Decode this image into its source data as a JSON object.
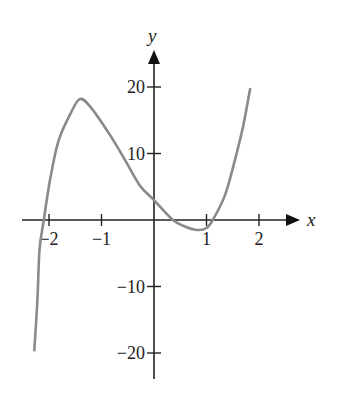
{
  "chart_data": {
    "type": "line",
    "title": "",
    "xlabel": "x",
    "ylabel": "y",
    "xlim": [
      -2.35,
      2.5
    ],
    "ylim": [
      -24,
      25
    ],
    "grid": false,
    "legend": null,
    "x_ticks": [
      -2,
      -1,
      1,
      2
    ],
    "x_tick_labels": [
      "−2",
      "−1",
      "1",
      "2"
    ],
    "y_ticks": [
      20,
      10,
      -10,
      -20
    ],
    "y_tick_labels": [
      "20",
      "10",
      "−10",
      "−20"
    ],
    "series": [
      {
        "name": "cubic curve",
        "color": "#8a8a8a",
        "x": [
          -2.28,
          -2.22,
          -2.18,
          -2.1,
          -1.98,
          -1.82,
          -1.59,
          -1.41,
          -1.2,
          -0.84,
          -0.55,
          -0.27,
          0.0,
          0.36,
          0.6,
          0.82,
          1.0,
          1.12,
          1.35,
          1.54,
          1.7,
          1.83
        ],
        "y": [
          -19.6,
          -12.0,
          -4.5,
          0.0,
          6.0,
          11.9,
          16.0,
          18.2,
          16.9,
          12.8,
          9.0,
          5.2,
          3.0,
          0.0,
          -1.0,
          -1.5,
          -1.2,
          0.0,
          3.7,
          9.0,
          14.2,
          19.7
        ]
      }
    ]
  }
}
